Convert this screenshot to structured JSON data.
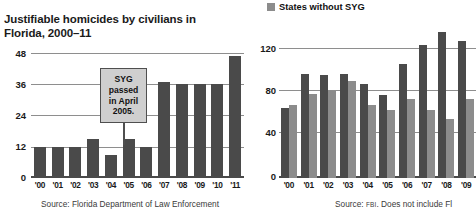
{
  "left": {
    "title_line1": "Justifiable homicides by civilians in",
    "title_line2": "Florida, 2000–11",
    "source": "Source: Florida Department of Law Enforcement",
    "callout": {
      "line1": "SYG",
      "line2": "passed",
      "line3": "in April",
      "line4": "2005."
    }
  },
  "right": {
    "legend": [
      {
        "label": "States without SYG",
        "color": "#8c8c8c"
      }
    ],
    "source_prefix": "Source:",
    "source_agency": "FBI",
    "source_suffix": ". Does not include Fl",
    "source_full": "Source: FBI. Does not include Fl"
  },
  "colors": {
    "bar_dark": "#4a4a4a",
    "bar_light": "#8c8c8c",
    "gridline": "#8e8e8e",
    "axis": "#4a4a4a",
    "callout_fill": "#cfcfcf",
    "callout_border": "#4f4f4f"
  },
  "chart_data": [
    {
      "type": "bar",
      "id": "florida-justifiable-homicides",
      "title": "Justifiable homicides by civilians in Florida, 2000–11",
      "xlabel": "",
      "ylabel": "",
      "ylim": [
        0,
        48
      ],
      "yticks": [
        0,
        12,
        24,
        36,
        48
      ],
      "grid": true,
      "legend": "none",
      "categories": [
        "'00",
        "'01",
        "'02",
        "'03",
        "'04",
        "'05",
        "'06",
        "'07",
        "'08",
        "'09",
        "'10",
        "'11"
      ],
      "values": [
        12,
        12,
        12,
        15,
        9,
        15,
        12,
        37,
        36,
        36,
        36,
        47
      ],
      "annotation": "SYG passed in April 2005.",
      "source": "Source: Florida Department of Law Enforcement"
    },
    {
      "type": "bar",
      "id": "states-without-syg",
      "title": "",
      "xlabel": "",
      "ylabel": "",
      "ylim": [
        0,
        140
      ],
      "yticks": [
        0,
        40,
        80,
        120
      ],
      "grid": true,
      "legend": "top",
      "categories": [
        "'00",
        "'01",
        "'02",
        "'03",
        "'04",
        "'05",
        "'06",
        "'07",
        "'08",
        "'09"
      ],
      "series": [
        {
          "name": "States with SYG",
          "color": "#4a4a4a",
          "values": [
            67,
            100,
            99,
            100,
            90,
            80,
            109,
            128,
            140,
            131
          ]
        },
        {
          "name": "States without SYG",
          "color": "#8c8c8c",
          "values": [
            70,
            81,
            83,
            93,
            70,
            65,
            76,
            65,
            57,
            76
          ]
        }
      ],
      "note": "Chart is cropped at the right edge of the screenshot.",
      "source": "Source: FBI. Does not include Fl"
    }
  ]
}
